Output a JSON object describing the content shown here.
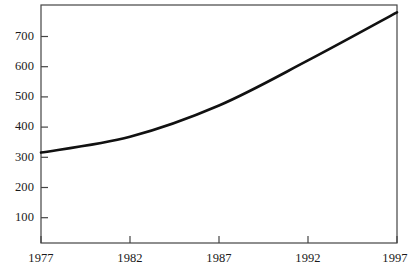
{
  "chart_data": {
    "type": "line",
    "title": "",
    "subtitle": "",
    "xlabel": "",
    "ylabel": "",
    "x": [
      1977,
      1982,
      1987,
      1992,
      1997
    ],
    "values": [
      283,
      330,
      423,
      557,
      700
    ],
    "series": [
      {
        "name": "",
        "values": [
          283,
          330,
          423,
          557,
          700
        ]
      }
    ],
    "categories": [
      "1977",
      "1982",
      "1987",
      "1992",
      "1997"
    ],
    "xtick_labels": [
      "1977",
      "1982",
      "1987",
      "1992",
      "1997"
    ],
    "ytick_labels": [
      "100",
      "200",
      "300",
      "400",
      "500",
      "600",
      "700"
    ],
    "ytick_values": [
      100,
      200,
      300,
      400,
      500,
      600,
      700
    ],
    "xlim": [
      1977,
      1997
    ],
    "ylim": [
      14,
      722
    ],
    "grid": false,
    "legend": false,
    "legend_position": "none",
    "line_color": "#111111",
    "axis_color": "#444444",
    "background_color": "#ffffff"
  }
}
